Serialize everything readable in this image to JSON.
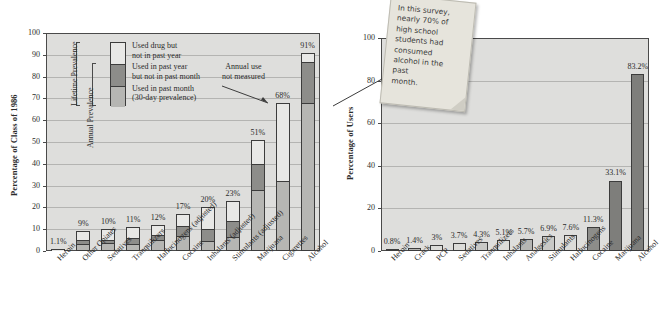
{
  "chart_data": [
    {
      "type": "bar",
      "id": "left-chart",
      "title": "",
      "xlabel": "",
      "ylabel": "Percentage of Class of 1986",
      "ylim": [
        0,
        100
      ],
      "yticks": [
        0,
        10,
        20,
        30,
        40,
        50,
        60,
        70,
        80,
        90,
        100
      ],
      "grid": true,
      "stacked": true,
      "legend_position": "inside-upper-left",
      "categories": [
        "Heroin",
        "Other Opiates",
        "Sedatives",
        "Tranquilizers",
        "Hallucinogens (adjusted)",
        "Cocaine",
        "Inhalants (adjusted)",
        "Stimulants (adjusted)",
        "Marijuana",
        "Cigarettes",
        "Alcohol"
      ],
      "series": [
        {
          "name": "Used in past month (30-day prevalence)",
          "color": "#b6b6b3",
          "values": [
            0.5,
            3,
            3.5,
            3,
            5,
            7,
            4.5,
            6,
            28,
            32,
            68
          ]
        },
        {
          "name": "Used in past year but not in past month",
          "color": "#8d8d8a",
          "values": [
            0.3,
            2,
            1.5,
            3,
            2.5,
            4.5,
            5.5,
            8,
            12,
            0,
            19
          ]
        },
        {
          "name": "Used drug but not in past year",
          "color": "#e8e8e6",
          "values": [
            0.3,
            4,
            5,
            5,
            4.5,
            5.5,
            10,
            9,
            11,
            36,
            4
          ]
        }
      ],
      "totals": [
        1.1,
        9,
        10,
        11,
        12,
        17,
        20,
        23,
        51,
        68,
        91
      ],
      "total_labels": [
        "1.1%",
        "9%",
        "10%",
        "11%",
        "12%",
        "17%",
        "20%",
        "23%",
        "51%",
        "68%",
        "91%"
      ],
      "annotations": [
        {
          "text": "Annual use\nnot measured",
          "points_to": "Cigarettes"
        }
      ]
    },
    {
      "type": "bar",
      "id": "right-chart",
      "title": "",
      "xlabel": "",
      "ylabel": "Percentage of Users",
      "ylim": [
        0,
        100
      ],
      "yticks": [
        0,
        20,
        40,
        60,
        80,
        100
      ],
      "grid": true,
      "stacked": false,
      "categories": [
        "Heroin",
        "Crack",
        "PCP",
        "Sedatives",
        "Tranquilizers",
        "Inhalants",
        "Analgesics",
        "Stimulants",
        "Hallucinogens",
        "Cocaine",
        "Marijuana",
        "Alcohol"
      ],
      "values": [
        0.8,
        1.4,
        3,
        3.7,
        4.3,
        5.1,
        5.7,
        6.9,
        7.6,
        11.3,
        33.1,
        83.2
      ],
      "value_labels": [
        "0.8%",
        "1.4%",
        "3%",
        "3.7%",
        "4.3%",
        "5.1%",
        "5.7%",
        "6.9%",
        "7.6%",
        "11.3%",
        "33.1%",
        "83.2%"
      ],
      "bar_colors": [
        "#dcdcd9",
        "#b6b6b3",
        "#dcdcd9",
        "#dcdcd9",
        "#c9c9c6",
        "#dcdcd9",
        "#b6b6b3",
        "#c9c9c6",
        "#dcdcd9",
        "#8d8d8a",
        "#7e7e7b",
        "#7e7e7b"
      ],
      "annotations": [
        {
          "text": "In this survey,\nnearly 70% of\nhigh school\nstudents had\nconsumed\nalcohol in the\npast\nmonth."
        }
      ]
    }
  ],
  "left_chart": {
    "ylabel": "Percentage of Class of 1986",
    "annotation": "Annual use\nnot measured",
    "legend": {
      "braces": [
        {
          "label": "Lifetime Prevalence"
        },
        {
          "label": "Annual Prevalence"
        }
      ],
      "rows": [
        {
          "label": "Used drug but\nnot in past year",
          "swatch": "#e8e8e6"
        },
        {
          "label": "Used in past year\nbut not in past month",
          "swatch": "#8d8d8a"
        },
        {
          "label": "Used in past month\n(30-day prevalence)",
          "swatch": "#b6b6b3"
        }
      ]
    }
  },
  "right_chart": {
    "ylabel": "Percentage of Users",
    "sticky_note": "In this survey,\nnearly 70% of\nhigh school\nstudents had\nconsumed\nalcohol in the\npast\nmonth."
  },
  "colors": {
    "plot_background": "#dededc",
    "axis": "#4a4a4a",
    "gridline": "#b4b4b2",
    "segment_light": "#e8e8e6",
    "segment_mid": "#8d8d8a",
    "segment_bottom": "#b6b6b3",
    "sticky_note": "#e6e4dc"
  }
}
